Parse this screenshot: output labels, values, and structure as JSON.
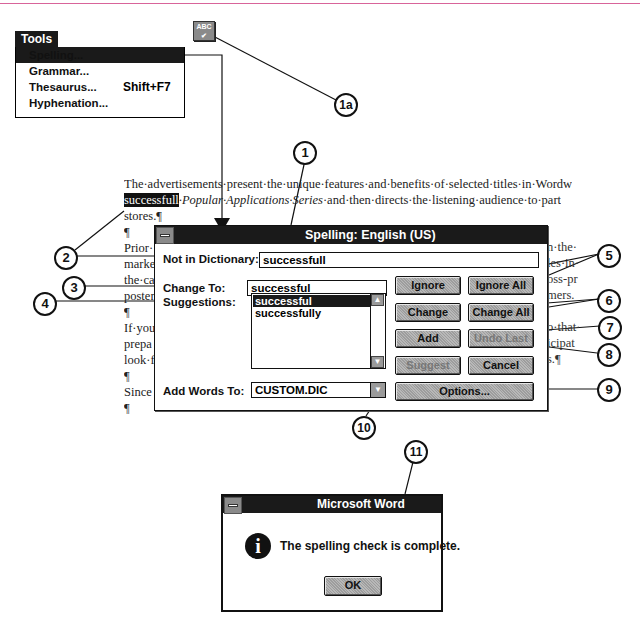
{
  "tools_menu": {
    "title": "Tools",
    "items": [
      {
        "label": "Spelling...",
        "shortcut": "",
        "selected": true
      },
      {
        "label": "Grammar...",
        "shortcut": "",
        "selected": false
      },
      {
        "label": "Thesaurus...",
        "shortcut": "Shift+F7",
        "selected": false
      },
      {
        "label": "Hyphenation...",
        "shortcut": "",
        "selected": false
      }
    ]
  },
  "toolbar": {
    "spelling_button_icon": "abc-check-icon",
    "spelling_button_text": "ABC"
  },
  "callouts": [
    "1",
    "1a",
    "2",
    "3",
    "4",
    "5",
    "6",
    "7",
    "8",
    "9",
    "10",
    "11"
  ],
  "document": {
    "line1": "The·advertisements·present·the·unique·features·and·benefits·of·selected·titles·in·Wordw",
    "line2_highlight": "successfull",
    "line2_italic": "·Popular·Applications·Series",
    "line2_rest": "·and·then·directs·the·listening·audience·to·part",
    "line3": "stores.¶",
    "line4": "¶",
    "left_fragments": [
      "Prior·",
      "marke",
      "the·ca",
      "poster",
      "¶",
      "If·you",
      "prepa",
      "look·f",
      "¶",
      "Since",
      "¶"
    ],
    "right_fragments": [
      "n·the·",
      "les·in·",
      "oss-pr",
      "mers.",
      "",
      "o·that·",
      "icipat",
      "s.¶"
    ]
  },
  "spelling_dialog": {
    "title": "Spelling: English (US)",
    "not_in_dictionary_label": "Not in Dictionary:",
    "not_in_dictionary_value": "successfull",
    "change_to_label": "Change To:",
    "change_to_value": "successful",
    "suggestions_label": "Suggestions:",
    "suggestions": [
      "successful",
      "successfully"
    ],
    "add_words_label": "Add Words To:",
    "add_words_value": "CUSTOM.DIC",
    "buttons": {
      "ignore": "Ignore",
      "ignore_all": "Ignore All",
      "change": "Change",
      "change_all": "Change All",
      "add": "Add",
      "undo_last": "Undo Last",
      "suggest": "Suggest",
      "cancel": "Cancel",
      "options": "Options..."
    }
  },
  "message_box": {
    "title": "Microsoft Word",
    "text": "The spelling check is complete.",
    "ok": "OK",
    "icon": "information-icon"
  }
}
